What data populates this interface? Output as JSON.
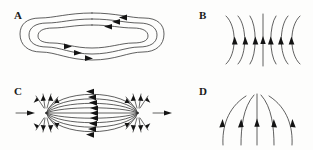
{
  "figure": {
    "width": 313,
    "height": 150,
    "background_color": "#fdfdfc",
    "line_color": "#2b2b2b",
    "arrow_color": "#141414",
    "label_color": "#1a1a1a",
    "caption": "Four field-line / flow patterns labelled A, B, C and D"
  },
  "panels": [
    {
      "id": "A",
      "label": "A",
      "label_x": 14,
      "label_y": 19,
      "pattern": "nested closed peanut-shaped loops",
      "description": "Three nested closed contours shaped like a peanut or dumbbell with a pinched waist at centre; flow runs leftwards along the top arcs and rightwards along the bottom arcs (counter-clockwise circulation).",
      "loop_count": 3,
      "flow_direction": "counter-clockwise",
      "arrow_count": 5,
      "center_x": 92,
      "center_y": 38
    },
    {
      "id": "B",
      "label": "B",
      "label_x": 199,
      "label_y": 19,
      "pattern": "converging curves about a vertical axis",
      "description": "Seven near-vertical lines: three on the left bowing to the right, one straight central line, and three on the right bowing to the left, all carrying upward-pointing arrowheads at mid height.",
      "line_count": 7,
      "flow_direction": "upward",
      "arrow_count": 7,
      "axis_x": 263,
      "center_y": 40
    },
    {
      "id": "C",
      "label": "C",
      "label_x": 14,
      "label_y": 95,
      "pattern": "two-pole dipole field",
      "description": "Lens-shaped field lines span horizontally between a left and a right pole; arrowheads on the lines point leftwards. Short straight segments fan outward above and below each pole, and a horizontal arrow enters at the far left and exits at the far right.",
      "line_count": 9,
      "flow_direction": "right to left along the lens lines",
      "left_pole_x": 46,
      "right_pole_x": 138,
      "center_y": 113
    },
    {
      "id": "D",
      "label": "D",
      "label_x": 199,
      "label_y": 95,
      "pattern": "upward fanning divergent lines",
      "description": "Five lines rise from the bottom and fan outward towards the top: two curving left, one straight and vertical in the centre, and two curving right, each carrying an upward-pointing arrowhead at mid height.",
      "line_count": 5,
      "flow_direction": "upward and outward",
      "arrow_count": 5,
      "axis_x": 257,
      "base_y": 145
    }
  ]
}
